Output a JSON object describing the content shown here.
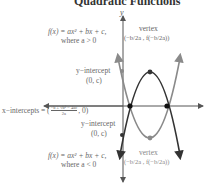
{
  "title": "Quadratic Functions",
  "axes": {
    "x_label": "x",
    "y_label": "y"
  },
  "labels": {
    "top_formula": "f(x) = ax² + bx + c,",
    "top_condition": "where a > 0",
    "top_vertex_title": "vertex",
    "top_vertex_coords": "(−b/2a , f(−b/2a))",
    "yint_top_title": "y−intercept",
    "yint_top_coords": "(0, c)",
    "xint_label": "x−intercepts = (",
    "xint_formula_num": "−b ± √b² − 4ac",
    "xint_formula_den": "2a",
    "xint_tail": ", 0)",
    "yint_bot_title": "y−intercept",
    "yint_bot_coords": "(0, c)",
    "bot_formula": "f(x) = ax² + bx + c,",
    "bot_condition": "where a < 0",
    "bot_vertex_title": "vertex",
    "bot_vertex_coords": "(−b/2a , f(−b/2a))"
  },
  "colors": {
    "dark_curve": "#333333",
    "gray_curve": "#8a8a8a",
    "axis": "#555555",
    "text": "#666666",
    "title": "#333333"
  }
}
